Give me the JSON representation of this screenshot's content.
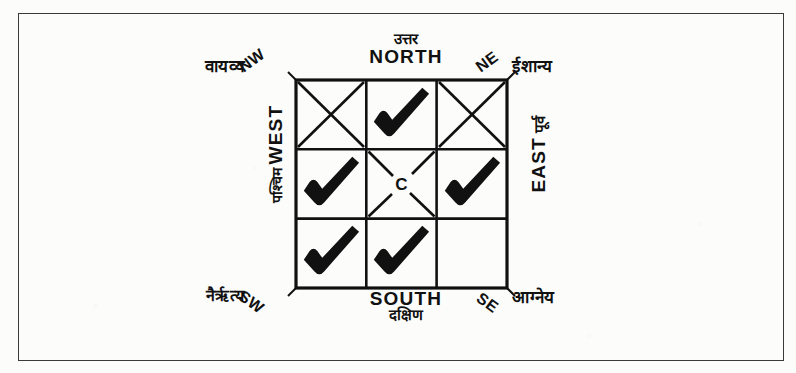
{
  "figure": {
    "center_letter": "C",
    "ink_color": "#111111",
    "paper_color": "#fcfcfb",
    "frame_color": "#3a3a3a"
  },
  "labels": {
    "north": {
      "hindi": "उत्तर",
      "english": "NORTH"
    },
    "south": {
      "english": "SOUTH",
      "hindi": "दक्षिण"
    },
    "east": {
      "english": "EAST",
      "hindi": "पूर्व"
    },
    "west": {
      "hindi": "पश्चिम",
      "english": "WEST"
    },
    "northwest": {
      "hindi": "वायव्य",
      "english": "NW"
    },
    "northeast": {
      "english": "NE",
      "hindi": "ईशान्य"
    },
    "southwest": {
      "hindi": "नैऋृत्य",
      "english": "SW"
    },
    "southeast": {
      "english": "SE",
      "hindi": "आग्नेय"
    }
  },
  "grid": {
    "rows": 3,
    "cols": 3,
    "cells": [
      {
        "position": "NW",
        "row": 0,
        "col": 0,
        "mark": "cross"
      },
      {
        "position": "N",
        "row": 0,
        "col": 1,
        "mark": "tick"
      },
      {
        "position": "NE",
        "row": 0,
        "col": 2,
        "mark": "cross"
      },
      {
        "position": "W",
        "row": 1,
        "col": 0,
        "mark": "tick"
      },
      {
        "position": "C",
        "row": 1,
        "col": 1,
        "mark": "cross-with-letter"
      },
      {
        "position": "E",
        "row": 1,
        "col": 2,
        "mark": "tick"
      },
      {
        "position": "SW",
        "row": 2,
        "col": 0,
        "mark": "tick"
      },
      {
        "position": "S",
        "row": 2,
        "col": 1,
        "mark": "tick"
      },
      {
        "position": "SE",
        "row": 2,
        "col": 2,
        "mark": "none"
      }
    ]
  }
}
